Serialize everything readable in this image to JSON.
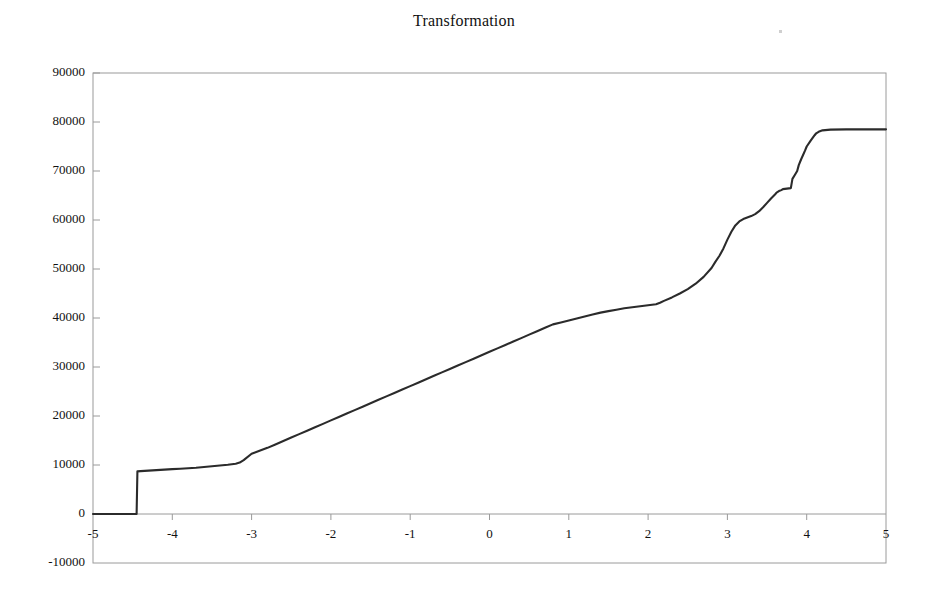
{
  "chart_data": {
    "type": "line",
    "title": "Transformation",
    "xlabel": "",
    "ylabel": "",
    "xlim": [
      -5,
      5
    ],
    "ylim": [
      -10000,
      90000
    ],
    "xticks": [
      -5,
      -4,
      -3,
      -2,
      -1,
      0,
      1,
      2,
      3,
      4,
      5
    ],
    "xtick_labels": [
      "-5",
      "-4",
      "-3",
      "-2",
      "-1",
      "0",
      "1",
      "2",
      "3",
      "4",
      "5"
    ],
    "yticks": [
      -10000,
      0,
      10000,
      20000,
      30000,
      40000,
      50000,
      60000,
      70000,
      80000,
      90000
    ],
    "ytick_labels": [
      "-10000",
      "0",
      "10000",
      "20000",
      "30000",
      "40000",
      "50000",
      "60000",
      "70000",
      "80000",
      "90000"
    ],
    "grid": false,
    "legend": null,
    "line_color": "#2b2b2b",
    "axis_color": "#8a8a8a",
    "zero_line_y": 0,
    "series": [
      {
        "name": "Transformation",
        "x": [
          -5.0,
          -4.8,
          -4.6,
          -4.47,
          -4.45,
          -4.44,
          -4.4,
          -4.3,
          -4.2,
          -4.1,
          -4.0,
          -3.9,
          -3.8,
          -3.7,
          -3.6,
          -3.5,
          -3.4,
          -3.3,
          -3.2,
          -3.15,
          -3.1,
          -3.0,
          -2.9,
          -2.8,
          -2.7,
          -2.6,
          -2.5,
          -2.4,
          -2.3,
          -2.2,
          -2.1,
          -2.0,
          -1.9,
          -1.8,
          -1.7,
          -1.6,
          -1.5,
          -1.4,
          -1.3,
          -1.2,
          -1.1,
          -1.0,
          -0.9,
          -0.8,
          -0.7,
          -0.6,
          -0.5,
          -0.4,
          -0.3,
          -0.2,
          -0.1,
          0.0,
          0.1,
          0.2,
          0.3,
          0.4,
          0.5,
          0.6,
          0.7,
          0.8,
          0.9,
          1.0,
          1.1,
          1.2,
          1.3,
          1.4,
          1.5,
          1.6,
          1.7,
          1.8,
          1.9,
          1.95,
          2.0,
          2.05,
          2.1,
          2.15,
          2.2,
          2.3,
          2.4,
          2.5,
          2.6,
          2.7,
          2.8,
          2.85,
          2.9,
          2.95,
          3.0,
          3.05,
          3.1,
          3.15,
          3.2,
          3.25,
          3.3,
          3.35,
          3.4,
          3.45,
          3.5,
          3.55,
          3.6,
          3.62,
          3.65,
          3.68,
          3.7,
          3.75,
          3.8,
          3.82,
          3.85,
          3.88,
          3.9,
          3.93,
          3.95,
          3.98,
          4.0,
          4.05,
          4.1,
          4.12,
          4.15,
          4.2,
          4.3,
          4.5,
          4.7,
          5.0
        ],
        "y": [
          0,
          0,
          0,
          0,
          0,
          8700,
          8750,
          8850,
          8950,
          9050,
          9150,
          9250,
          9350,
          9450,
          9600,
          9750,
          9900,
          10050,
          10250,
          10500,
          11000,
          12300,
          12900,
          13500,
          14200,
          14900,
          15600,
          16300,
          17000,
          17700,
          18400,
          19100,
          19800,
          20500,
          21200,
          21900,
          22600,
          23300,
          24000,
          24700,
          25400,
          26100,
          26800,
          27500,
          28200,
          28900,
          29600,
          30300,
          31000,
          31700,
          32400,
          33100,
          33800,
          34500,
          35200,
          35900,
          36600,
          37300,
          38000,
          38700,
          39100,
          39500,
          39900,
          40300,
          40700,
          41100,
          41400,
          41700,
          42000,
          42200,
          42400,
          42500,
          42600,
          42700,
          42800,
          43100,
          43500,
          44200,
          45000,
          45900,
          47000,
          48400,
          50200,
          51500,
          52700,
          54200,
          56000,
          57600,
          58900,
          59700,
          60200,
          60500,
          60800,
          61200,
          61800,
          62600,
          63500,
          64400,
          65200,
          65600,
          65900,
          66100,
          66300,
          66400,
          66500,
          68400,
          69200,
          70000,
          71200,
          72400,
          73100,
          74200,
          75000,
          76200,
          77300,
          77700,
          78000,
          78300,
          78450,
          78500,
          78500,
          78500
        ]
      }
    ],
    "annotations": [
      {
        "text": "step jump at x = -4.45 from 0 to ~8700"
      },
      {
        "text": "plateau tail at ~78500 from x = 4.2 to 5"
      }
    ]
  },
  "figure": {
    "title": "Transformation",
    "background": "#ffffff"
  }
}
